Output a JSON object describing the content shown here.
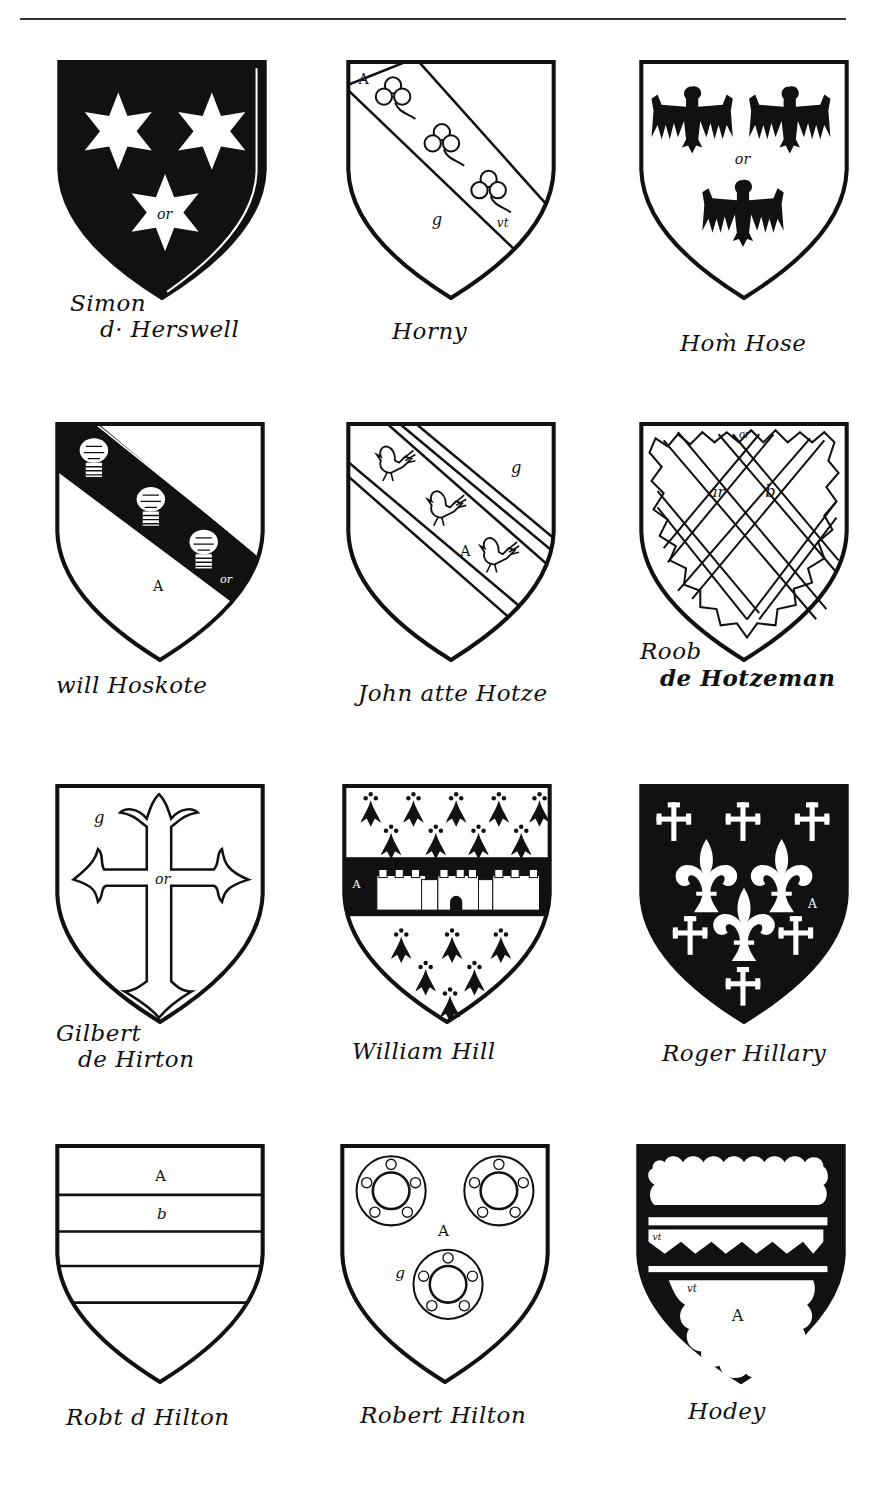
{
  "page": {
    "rule": "horizontal rule at top of page"
  },
  "shields": [
    {
      "id": "simon-de-hersewell",
      "label_line1": "Simon",
      "label_line2": "d· Herswell",
      "field": "sable",
      "charge": "three mullets of six points",
      "tinctures": [
        "or"
      ]
    },
    {
      "id": "horny",
      "label_line1": "Horny",
      "label_line2": "",
      "field": "argent",
      "charge": "bend with three trefoils slipped",
      "tinctures": [
        "A",
        "g",
        "vt"
      ]
    },
    {
      "id": "hom-hose",
      "label_line1": "Hom̀ Hose",
      "label_line2": "",
      "field": "argent",
      "charge": "three eagles displayed",
      "tinctures": [
        "or"
      ]
    },
    {
      "id": "will-hoskote",
      "label_line1": "will Hoskote",
      "label_line2": "",
      "field": "argent",
      "charge": "bend with three garbs",
      "tinctures": [
        "A",
        "or"
      ]
    },
    {
      "id": "john-atte-hotze",
      "label_line1": "John atte Hotze",
      "label_line2": "",
      "field": "argent",
      "charge": "bend cotised with three birds",
      "tinctures": [
        "g",
        "A"
      ]
    },
    {
      "id": "roger-de-hotzeman",
      "label_line1": "Roob",
      "label_line2": "de Hotzeman",
      "field": "or",
      "charge": "fretty with border engrailed",
      "tinctures": [
        "or",
        "ar",
        "b"
      ]
    },
    {
      "id": "gilbert-de-hirton",
      "label_line1": "Gilbert",
      "label_line2": "de Hirton",
      "field": "gules",
      "charge": "cross patonce",
      "tinctures": [
        "g",
        "or"
      ]
    },
    {
      "id": "william-hill",
      "label_line1": "William Hill",
      "label_line2": "",
      "field": "ermine",
      "charge": "fess with castle",
      "tinctures": [
        "A"
      ]
    },
    {
      "id": "roger-hillary",
      "label_line1": "Roger Hillary",
      "label_line2": "",
      "field": "sable",
      "charge": "three fleurs-de-lis between crosses crosslet",
      "tinctures": [
        "A"
      ]
    },
    {
      "id": "robert-de-hilton",
      "label_line1": "Robt d Hilton",
      "label_line2": "",
      "field": "barry",
      "charge": "barry of argent and azure",
      "tinctures": [
        "A",
        "b"
      ]
    },
    {
      "id": "robert-hilton",
      "label_line1": "Robert Hilton",
      "label_line2": "",
      "field": "argent",
      "charge": "three annulets charged with roses",
      "tinctures": [
        "A",
        "g"
      ]
    },
    {
      "id": "hodey",
      "label_line1": "Hodey",
      "label_line2": "",
      "field": "sable",
      "charge": "cloudy chief and base with fess dancetty",
      "tinctures": [
        "A",
        "vt"
      ]
    }
  ],
  "glyphs": {
    "or": "or",
    "A": "A",
    "g": "g",
    "vt": "vt",
    "ar": "ar",
    "b": "b"
  }
}
